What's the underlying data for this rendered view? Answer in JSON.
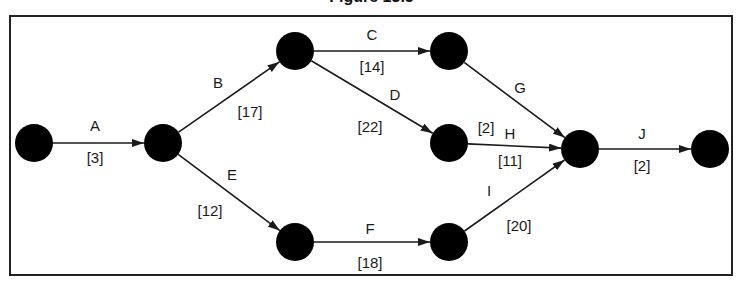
{
  "figure": {
    "caption_partial": "Figure 13.5",
    "frame": {
      "x": 10,
      "y": 16,
      "width": 722,
      "height": 259,
      "stroke": "#222222"
    },
    "node_color": "#000000",
    "edge_color": "#1a1a1a"
  },
  "nodes": [
    {
      "id": "n1",
      "x": 34,
      "y": 143,
      "r": 19
    },
    {
      "id": "n2",
      "x": 163,
      "y": 143,
      "r": 19
    },
    {
      "id": "n3",
      "x": 295,
      "y": 51,
      "r": 19
    },
    {
      "id": "n4",
      "x": 449,
      "y": 51,
      "r": 19
    },
    {
      "id": "n5",
      "x": 449,
      "y": 143,
      "r": 19
    },
    {
      "id": "n6",
      "x": 295,
      "y": 242,
      "r": 19
    },
    {
      "id": "n7",
      "x": 449,
      "y": 242,
      "r": 19
    },
    {
      "id": "n8",
      "x": 580,
      "y": 149,
      "r": 19
    },
    {
      "id": "n9",
      "x": 710,
      "y": 149,
      "r": 19
    }
  ],
  "edges": [
    {
      "activity": "A",
      "duration": "[3]",
      "from": "n1",
      "to": "n2",
      "label_pos": [
        95,
        131
      ],
      "duration_pos": [
        95,
        163
      ]
    },
    {
      "activity": "B",
      "duration": "[17]",
      "from": "n2",
      "to": "n3",
      "label_pos": [
        218,
        88
      ],
      "duration_pos": [
        250,
        117
      ]
    },
    {
      "activity": "C",
      "duration": "[14]",
      "from": "n3",
      "to": "n4",
      "label_pos": [
        372,
        40
      ],
      "duration_pos": [
        372,
        72
      ]
    },
    {
      "activity": "D",
      "duration": "[22]",
      "from": "n3",
      "to": "n5",
      "label_pos": [
        395,
        100
      ],
      "duration_pos": [
        370,
        132
      ]
    },
    {
      "activity": "E",
      "duration": "[12]",
      "from": "n2",
      "to": "n6",
      "label_pos": [
        232,
        180
      ],
      "duration_pos": [
        210,
        216
      ]
    },
    {
      "activity": "F",
      "duration": "[18]",
      "from": "n6",
      "to": "n7",
      "label_pos": [
        370,
        234
      ],
      "duration_pos": [
        370,
        268
      ]
    },
    {
      "activity": "G",
      "duration": "[2]",
      "from": "n4",
      "to": "n8",
      "label_pos": [
        520,
        93
      ],
      "duration_pos": [
        486,
        133
      ]
    },
    {
      "activity": "H",
      "duration": "[11]",
      "from": "n5",
      "to": "n8",
      "label_pos": [
        510,
        139
      ],
      "duration_pos": [
        510,
        166
      ]
    },
    {
      "activity": "I",
      "duration": "[20]",
      "from": "n7",
      "to": "n8",
      "label_pos": [
        489,
        196
      ],
      "duration_pos": [
        519,
        231
      ]
    },
    {
      "activity": "J",
      "duration": "[2]",
      "from": "n8",
      "to": "n9",
      "label_pos": [
        642,
        139
      ],
      "duration_pos": [
        642,
        171
      ]
    }
  ]
}
